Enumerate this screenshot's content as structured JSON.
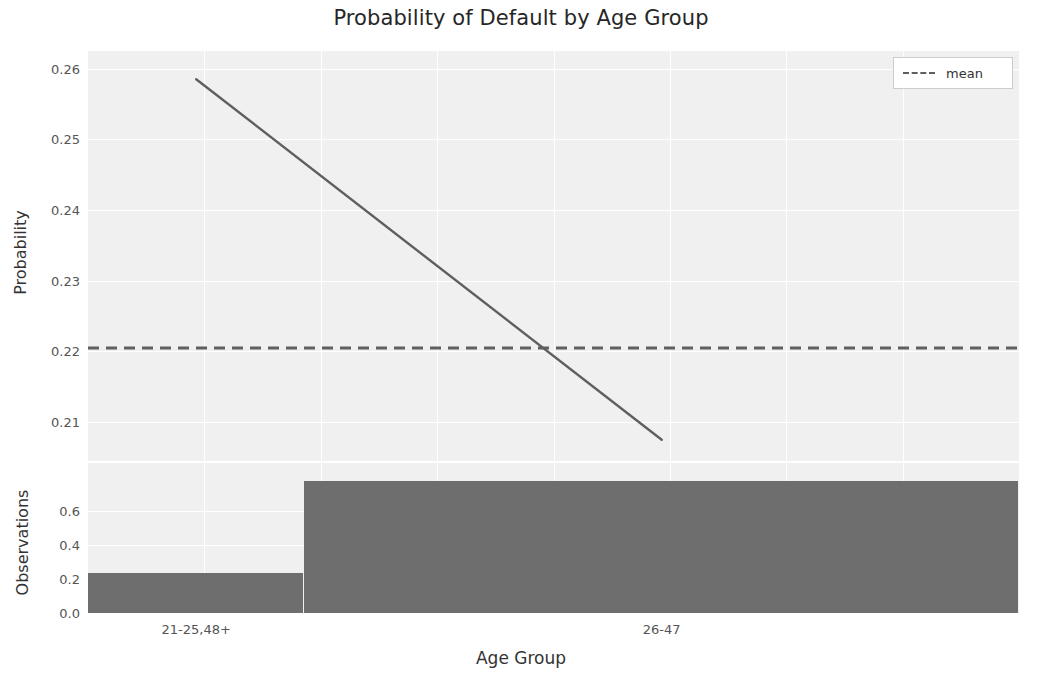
{
  "chart_data": {
    "type": "line",
    "title": "Probability of Default by Age Group",
    "xlabel": "Age Group",
    "categories": [
      "21-25,48+",
      "26-47"
    ],
    "panels": [
      {
        "name": "probability",
        "ylabel": "Probability",
        "ylim": [
          0.2045,
          0.2625
        ],
        "yticks": [
          0.26,
          0.25,
          0.24,
          0.23,
          0.22,
          0.21
        ],
        "ytick_labels": [
          "0.26",
          "0.25",
          "0.24",
          "0.23",
          "0.22",
          "0.21"
        ],
        "grid": true,
        "series": [
          {
            "name": "probability of default",
            "type": "line",
            "color": "#5f5f5f",
            "style": "solid",
            "values": [
              0.2585,
              0.2075
            ]
          },
          {
            "name": "mean",
            "type": "hline",
            "color": "#5f5f5f",
            "style": "dashed",
            "value": 0.2205
          }
        ]
      },
      {
        "name": "observations",
        "ylabel": "Observations",
        "ylim": [
          0.0,
          0.88
        ],
        "yticks": [
          0.6,
          0.4,
          0.2,
          0.0
        ],
        "ytick_labels": [
          "0.6",
          "0.4",
          "0.2",
          "0.0"
        ],
        "grid": true,
        "series": [
          {
            "name": "observation share",
            "type": "bar",
            "color": "#6e6e6e",
            "values": [
              0.235,
              0.776
            ]
          }
        ]
      }
    ],
    "legend": {
      "position": "upper right",
      "entries": [
        {
          "label": "mean",
          "style": "dashed",
          "color": "#5f5f5f"
        }
      ]
    }
  },
  "figure": {
    "background": "#ffffff",
    "panel_background": "#f0f0f0",
    "grid_color": "#ffffff",
    "text_color": "#262626"
  }
}
